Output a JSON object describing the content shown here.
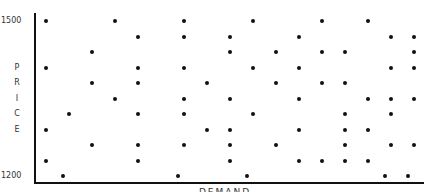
{
  "chart_data": {
    "type": "scatter",
    "title": "",
    "xlabel": "DEMAND",
    "ylabel": "PRICE",
    "ylabel_chars": [
      "P",
      "R",
      "I",
      "C",
      "E"
    ],
    "yticks": [
      "1500",
      "1200"
    ],
    "ylim": [
      1200,
      1500
    ],
    "grid": false,
    "legend": null,
    "points_px": [
      [
        46,
        21
      ],
      [
        115,
        21
      ],
      [
        184,
        21
      ],
      [
        253,
        21
      ],
      [
        322,
        21
      ],
      [
        368,
        21
      ],
      [
        138,
        37
      ],
      [
        184,
        37
      ],
      [
        230,
        37
      ],
      [
        299,
        37
      ],
      [
        391,
        37
      ],
      [
        414,
        37
      ],
      [
        92,
        52
      ],
      [
        230,
        52
      ],
      [
        276,
        52
      ],
      [
        322,
        52
      ],
      [
        345,
        52
      ],
      [
        414,
        52
      ],
      [
        46,
        68
      ],
      [
        138,
        68
      ],
      [
        184,
        68
      ],
      [
        253,
        68
      ],
      [
        299,
        68
      ],
      [
        391,
        68
      ],
      [
        414,
        68
      ],
      [
        92,
        83
      ],
      [
        138,
        83
      ],
      [
        207,
        83
      ],
      [
        276,
        83
      ],
      [
        322,
        83
      ],
      [
        345,
        83
      ],
      [
        115,
        99
      ],
      [
        184,
        99
      ],
      [
        230,
        99
      ],
      [
        299,
        99
      ],
      [
        368,
        99
      ],
      [
        391,
        99
      ],
      [
        414,
        99
      ],
      [
        69,
        114
      ],
      [
        138,
        114
      ],
      [
        184,
        114
      ],
      [
        253,
        114
      ],
      [
        345,
        114
      ],
      [
        391,
        114
      ],
      [
        46,
        130
      ],
      [
        207,
        130
      ],
      [
        230,
        130
      ],
      [
        299,
        130
      ],
      [
        345,
        130
      ],
      [
        368,
        130
      ],
      [
        92,
        145
      ],
      [
        138,
        145
      ],
      [
        184,
        145
      ],
      [
        230,
        145
      ],
      [
        276,
        145
      ],
      [
        345,
        145
      ],
      [
        391,
        145
      ],
      [
        414,
        145
      ],
      [
        46,
        161
      ],
      [
        138,
        161
      ],
      [
        230,
        161
      ],
      [
        299,
        161
      ],
      [
        322,
        161
      ],
      [
        345,
        161
      ],
      [
        368,
        161
      ],
      [
        63,
        176
      ],
      [
        178,
        176
      ],
      [
        247,
        176
      ],
      [
        385,
        176
      ],
      [
        408,
        176
      ]
    ]
  },
  "colors": {
    "axis": "#111111",
    "dot": "#111111",
    "text": "#333333",
    "background": "#ffffff"
  }
}
